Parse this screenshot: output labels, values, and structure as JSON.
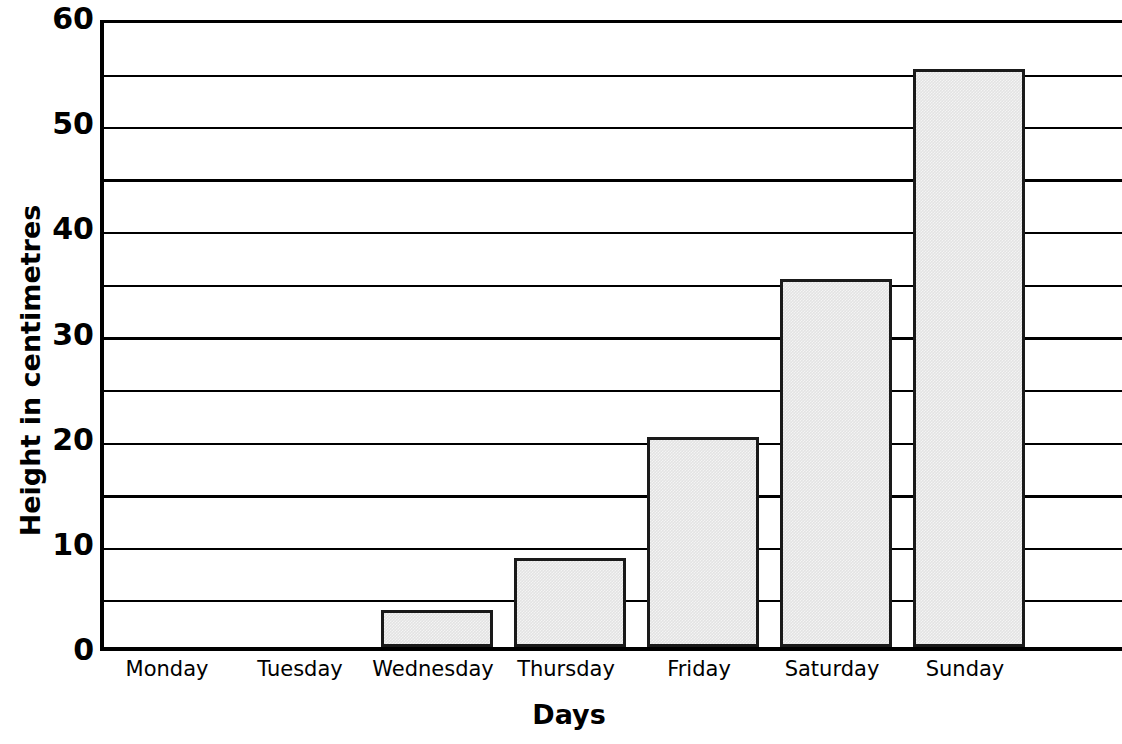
{
  "chart_data": {
    "type": "bar",
    "title": "",
    "xlabel": "Days",
    "ylabel": "Height in centimetres",
    "categories": [
      "Monday",
      "Tuesday",
      "Wednesday",
      "Thursday",
      "Friday",
      "Saturday",
      "Sunday"
    ],
    "values": [
      0,
      0,
      3.5,
      8.5,
      20,
      35,
      55
    ],
    "ylim": [
      0,
      60
    ],
    "y_major_ticks": [
      0,
      10,
      20,
      30,
      40,
      50,
      60
    ],
    "y_tick_labels": [
      "0",
      "10",
      "20",
      "30",
      "40",
      "50",
      "60"
    ],
    "y_gridlines_minor": [
      5,
      10,
      20,
      25,
      35,
      40,
      50,
      55
    ],
    "y_gridlines_major": [
      15,
      30,
      45
    ],
    "grid": true,
    "legend": false,
    "bar_fill_color": "#e3e3e3",
    "bar_edge_color": "#1a1a1a",
    "axis_color": "#000000",
    "background_color": "#ffffff"
  },
  "axes": {
    "y_title": "Height in centimetres",
    "x_title": "Days"
  }
}
